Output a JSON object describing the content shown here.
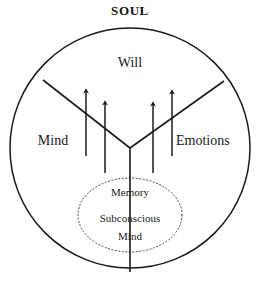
{
  "diagram": {
    "title": "SOUL",
    "type": "concept-venn",
    "background_color": "#ffffff",
    "stroke_color": "#1a1a1a",
    "text_color": "#1a1a1a",
    "outer_boundary": {
      "name": "soul-circle",
      "shape": "circle",
      "center_x": 130,
      "center_y": 148,
      "radius": 120,
      "stroke_style": "solid"
    },
    "inner_boundary": {
      "name": "subconscious-ellipse",
      "shape": "ellipse",
      "center_x": 130,
      "center_y": 215,
      "radius_x": 52,
      "radius_y": 37,
      "stroke_style": "dotted"
    },
    "regions": [
      {
        "id": "will",
        "label": "Will"
      },
      {
        "id": "mind",
        "label": "Mind"
      },
      {
        "id": "emotions",
        "label": "Emotions"
      }
    ],
    "inner_labels": [
      {
        "id": "memory",
        "label": "Memory"
      },
      {
        "id": "subconscious",
        "label": "Subconscious"
      },
      {
        "id": "subconscious-mind",
        "label": "Mind"
      }
    ],
    "divider_lines": [
      {
        "id": "left-divider",
        "x1": 43,
        "y1": 80,
        "x2": 130,
        "y2": 148
      },
      {
        "id": "right-divider",
        "x1": 224,
        "y1": 81,
        "x2": 130,
        "y2": 148
      },
      {
        "id": "center-stem",
        "x1": 130,
        "y1": 148,
        "x2": 130,
        "y2": 272
      }
    ],
    "arrows": [
      {
        "id": "arrow-1",
        "x": 86,
        "tip_y": 87,
        "tail_y": 156,
        "direction": "up"
      },
      {
        "id": "arrow-2",
        "x": 105,
        "tip_y": 99,
        "tail_y": 173,
        "direction": "up"
      },
      {
        "id": "arrow-3",
        "x": 153,
        "tip_y": 100,
        "tail_y": 173,
        "direction": "up"
      },
      {
        "id": "arrow-4",
        "x": 172,
        "tip_y": 88,
        "tail_y": 156,
        "direction": "up"
      }
    ]
  }
}
